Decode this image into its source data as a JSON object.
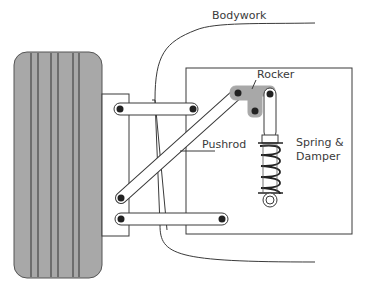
{
  "diagram": {
    "type": "pushrod-suspension-schematic",
    "labels": {
      "bodywork": "Bodywork",
      "rocker": "Rocker",
      "pushrod": "Pushrod",
      "spring_line1": "Spring &",
      "spring_line2": "Damper"
    },
    "colors": {
      "tire_fill": "#a8a8a8",
      "line": "#3a3a3a",
      "rocker_fill": "#a8a8a8",
      "background": "#ffffff"
    },
    "components": [
      "Tire",
      "Upright",
      "Upper wishbone",
      "Lower wishbone",
      "Pushrod",
      "Rocker",
      "Spring & Damper",
      "Chassis",
      "Bodywork"
    ]
  }
}
